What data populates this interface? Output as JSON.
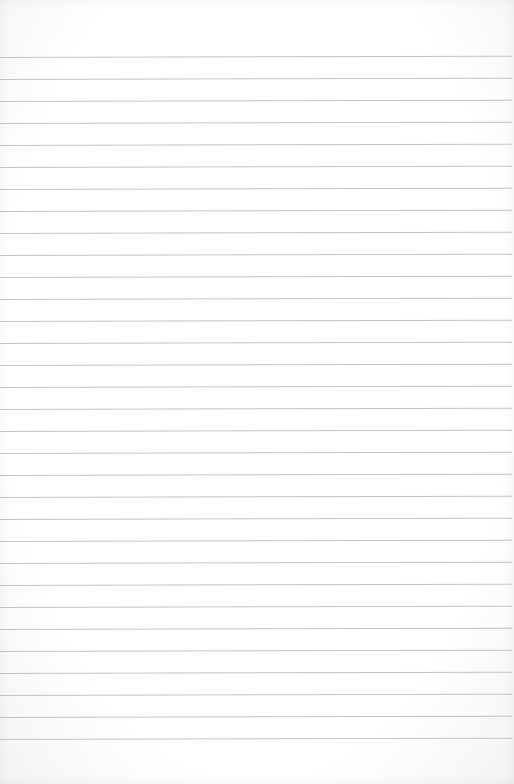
{
  "image": {
    "description": "Blank sheet of ruled notebook paper",
    "background_color": "#ffffff",
    "rule_color": "#b9b9b9",
    "rule_count": 32,
    "first_rule_y": 57,
    "rule_spacing_px": 22
  }
}
